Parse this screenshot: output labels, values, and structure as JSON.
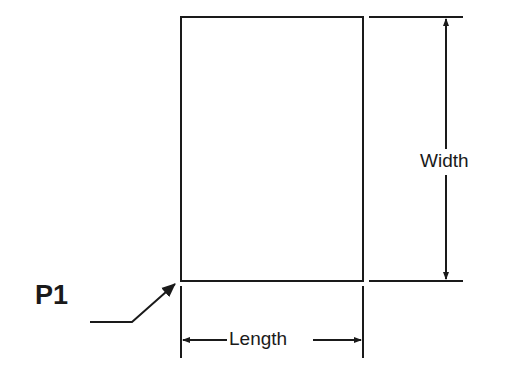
{
  "diagram": {
    "labels": {
      "width": "Width",
      "length": "Length",
      "point": "P1"
    },
    "colors": {
      "line": "#1a1a1a",
      "background": "#ffffff"
    }
  }
}
